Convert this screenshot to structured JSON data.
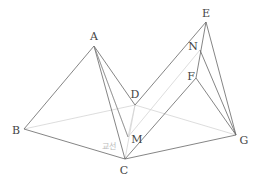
{
  "diagram": {
    "type": "3d-geometry",
    "points": {
      "A": {
        "label": "A",
        "x": 94,
        "y": 46,
        "lx": 94,
        "ly": 40
      },
      "B": {
        "label": "B",
        "x": 24,
        "y": 129,
        "lx": 16,
        "ly": 134
      },
      "C": {
        "label": "C",
        "x": 125,
        "y": 159,
        "lx": 124,
        "ly": 172
      },
      "D": {
        "label": "D",
        "x": 135,
        "y": 105,
        "lx": 135,
        "ly": 97
      },
      "E": {
        "label": "E",
        "x": 206,
        "y": 22,
        "lx": 206,
        "ly": 17
      },
      "N": {
        "label": "N",
        "x": 200,
        "y": 50,
        "lx": 193,
        "ly": 49
      },
      "F": {
        "label": "F",
        "x": 196,
        "y": 78,
        "lx": 191,
        "ly": 79
      },
      "M": {
        "label": "M",
        "x": 128,
        "y": 137,
        "lx": 137,
        "ly": 142
      },
      "G": {
        "label": "G",
        "x": 236,
        "y": 135,
        "lx": 243,
        "ly": 143
      }
    },
    "annotation": {
      "text": "교선",
      "x": 102,
      "y": 146
    },
    "colors": {
      "edge": "#666666",
      "hidden": "#d4d4d4",
      "label": "#444444"
    }
  }
}
